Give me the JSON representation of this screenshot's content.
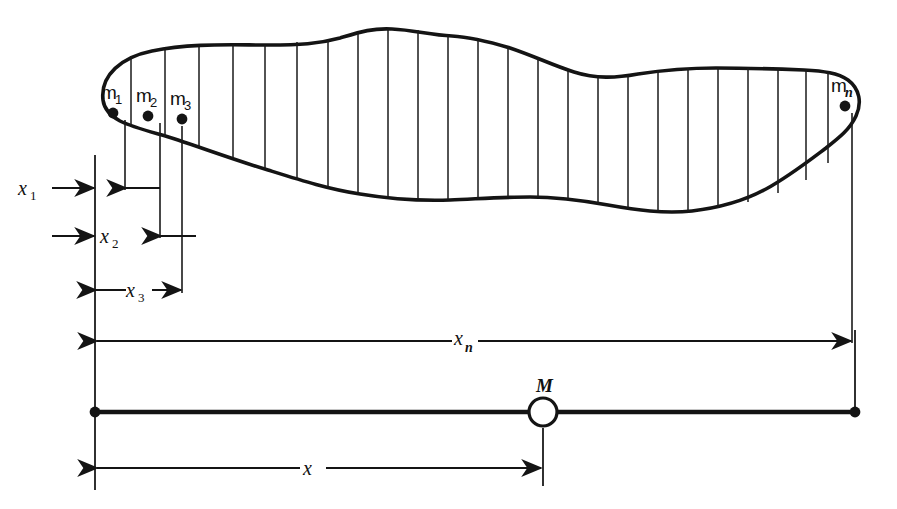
{
  "figure": {
    "background_color": "#ffffff",
    "ink_color": "#141414"
  },
  "body_region": {
    "name": "irregular-lamina",
    "strip_count": 25,
    "description": "Irregular closed blob subdivided into vertical strips"
  },
  "masses": [
    {
      "id": "m1",
      "base": "m",
      "subscript": "1",
      "label": "m₁",
      "dot_x": 113,
      "dot_y": 113
    },
    {
      "id": "m2",
      "base": "m",
      "subscript": "2",
      "label": "m₂",
      "dot_x": 148,
      "dot_y": 116
    },
    {
      "id": "m3",
      "base": "m",
      "subscript": "3",
      "label": "m₃",
      "dot_x": 182,
      "dot_y": 119
    },
    {
      "id": "mn",
      "base": "m",
      "subscript": "n",
      "label": "mₙ",
      "dot_x": 845,
      "dot_y": 106
    }
  ],
  "dimensions": [
    {
      "id": "x1",
      "base": "x",
      "subscript": "1",
      "label": "x₁",
      "from": 95,
      "to": 125,
      "y": 188,
      "label_x": 30,
      "label_y": 190
    },
    {
      "id": "x2",
      "base": "x",
      "subscript": "2",
      "label": "x₂",
      "from": 95,
      "to": 160,
      "y": 236,
      "label_x": 110,
      "label_y": 238
    },
    {
      "id": "x3",
      "base": "x",
      "subscript": "3",
      "label": "x₃",
      "from": 95,
      "to": 182,
      "y": 290,
      "label_x": 130,
      "label_y": 292
    },
    {
      "id": "xn",
      "base": "x",
      "subscript": "n",
      "label": "xₙ",
      "from": 95,
      "to": 852,
      "y": 341,
      "label_x": 466,
      "label_y": 338
    },
    {
      "id": "x",
      "base": "x",
      "subscript": "",
      "label": "x",
      "from": 95,
      "to": 543,
      "y": 468,
      "label_x": 312,
      "label_y": 463
    }
  ],
  "pivot": {
    "id": "M",
    "label": "M",
    "label_x": 543,
    "label_y": 387,
    "center_x": 543,
    "center_y": 412,
    "radius": 14
  },
  "beam": {
    "name": "equivalent-beam",
    "y": 412,
    "left_x": 95,
    "right_x": 855
  },
  "reference_lines": {
    "left_x": 95,
    "right_x": 855
  }
}
